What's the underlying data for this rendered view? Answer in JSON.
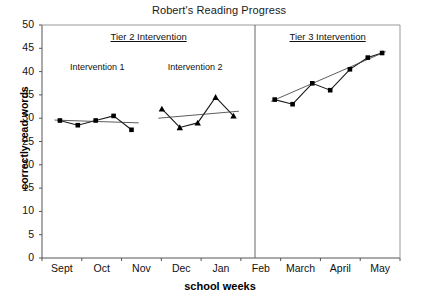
{
  "chart_data": {
    "type": "line",
    "title": "Robert's Reading Progress",
    "xlabel": "school weeks",
    "ylabel": "correctly read words",
    "ylim": [
      0,
      50
    ],
    "ytick_labels": [
      "50",
      "45",
      "40",
      "35",
      "30",
      "25",
      "20",
      "15",
      "10",
      "5",
      "0"
    ],
    "ytick_values": [
      50,
      45,
      40,
      35,
      30,
      25,
      20,
      15,
      10,
      5,
      0
    ],
    "xtick_labels": [
      "Sept",
      "Oct",
      "Nov",
      "Dec",
      "Jan",
      "Feb",
      "March",
      "April",
      "May"
    ],
    "grid": false,
    "legend": "none",
    "phase_labels": [
      {
        "text": "Tier 2 Intervention"
      },
      {
        "text": "Tier 3 Intervention"
      }
    ],
    "condition_labels": [
      {
        "text": "Intervention 1"
      },
      {
        "text": "Intervention 2"
      }
    ],
    "series": [
      {
        "name": "Intervention 1",
        "marker": "square",
        "x": [
          1,
          2,
          3,
          4,
          5
        ],
        "values": [
          29.5,
          28.5,
          29.5,
          30.5,
          27.5
        ],
        "trend": {
          "x": [
            0.7,
            5.4
          ],
          "values": [
            29.6,
            29.0
          ]
        }
      },
      {
        "name": "Intervention 2",
        "marker": "triangle",
        "x": [
          6.7,
          7.7,
          8.7,
          9.7,
          10.7
        ],
        "values": [
          32.0,
          28.0,
          29.0,
          34.5,
          30.5
        ],
        "trend": {
          "x": [
            6.5,
            11.0
          ],
          "values": [
            30.0,
            31.5
          ]
        }
      },
      {
        "name": "Tier 3 Intervention",
        "marker": "square",
        "x": [
          13.0,
          14.0,
          15.1,
          16.1,
          17.2,
          18.2,
          19.0
        ],
        "values": [
          34.0,
          33.0,
          37.5,
          36.0,
          40.5,
          43.0,
          44.0
        ],
        "trend": {
          "x": [
            12.8,
            19.2
          ],
          "values": [
            33.6,
            44.3
          ]
        }
      }
    ],
    "phase_divider_x": 11.9,
    "colors": {
      "line": "#1a1a1a",
      "marker": "#000000",
      "axis": "#444444",
      "background": "#ffffff"
    }
  }
}
